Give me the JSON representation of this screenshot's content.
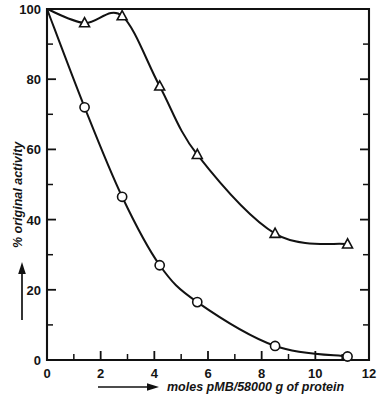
{
  "chart_data": {
    "type": "line",
    "title": "",
    "subtitle": "",
    "xlabel": "moles pMB/58000 g of protein",
    "ylabel": "% original activity",
    "xlim": [
      0,
      12
    ],
    "ylim": [
      0,
      100
    ],
    "grid": false,
    "legend_position": "none",
    "x_ticks_major": [
      0,
      2,
      4,
      6,
      8,
      10,
      12
    ],
    "x_tick_labels": [
      "0",
      "2",
      "4",
      "6",
      "8",
      "10",
      "12"
    ],
    "x_ticks_minor": [
      1,
      3,
      5,
      7,
      9,
      11
    ],
    "y_ticks_major": [
      0,
      20,
      40,
      60,
      80,
      100
    ],
    "y_tick_labels": [
      "0",
      "20",
      "40",
      "60",
      "80",
      "100"
    ],
    "y_ticks_minor": [
      10,
      30,
      50,
      70,
      90
    ],
    "series": [
      {
        "name": "circle-series",
        "marker": "circle",
        "x": [
          0,
          1.4,
          2.8,
          4.2,
          5.6,
          8.5,
          11.2
        ],
        "values": [
          100,
          72,
          46.5,
          27,
          16.5,
          4,
          1
        ]
      },
      {
        "name": "triangle-series",
        "marker": "triangle",
        "x": [
          0,
          1.4,
          2.8,
          4.2,
          5.6,
          8.5,
          11.2
        ],
        "values": [
          100,
          96,
          98,
          78,
          58.5,
          36,
          33
        ]
      }
    ],
    "annotations": [
      {
        "name": "y-axis-arrow",
        "direction": "up"
      },
      {
        "name": "x-axis-arrow",
        "direction": "right"
      }
    ]
  },
  "axis": {
    "x_title": "moles pMB/58000 g of protein",
    "y_title": "% original activity",
    "x_labels": [
      "0",
      "2",
      "4",
      "6",
      "8",
      "10",
      "12"
    ],
    "y_labels": [
      "0",
      "20",
      "40",
      "60",
      "80",
      "100"
    ]
  },
  "colors": {
    "ink": "#111111",
    "paper": "#ffffff",
    "marker_fill": "#ffffff"
  }
}
